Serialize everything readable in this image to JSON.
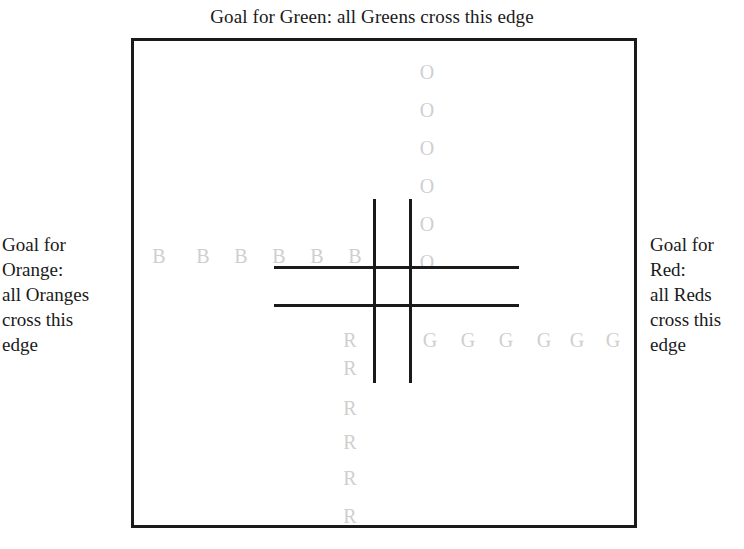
{
  "board": {
    "top_caption": "Goal for Green: all Greens cross this edge",
    "left_caption": {
      "lines": [
        "Goal for",
        "Orange:",
        "all Oranges",
        "cross this",
        "edge"
      ]
    },
    "right_caption": {
      "lines": [
        "Goal for",
        "Red:",
        "all Reds",
        "cross this",
        "edge"
      ]
    },
    "border_color": "#1a1a1a",
    "piece_color": "#cfcfcf",
    "grid_line_color": "#1a1a1a"
  },
  "pieces": {
    "orange": {
      "label": "O",
      "count": 6,
      "orientation": "column",
      "items": [
        {
          "glyph": "O",
          "x": 427,
          "y": 62
        },
        {
          "glyph": "O",
          "x": 427,
          "y": 100
        },
        {
          "glyph": "O",
          "x": 427,
          "y": 138
        },
        {
          "glyph": "O",
          "x": 427,
          "y": 176
        },
        {
          "glyph": "O",
          "x": 427,
          "y": 214
        },
        {
          "glyph": "O",
          "x": 427,
          "y": 252
        }
      ]
    },
    "blue": {
      "label": "B",
      "count": 6,
      "orientation": "row",
      "items": [
        {
          "glyph": "B",
          "x": 159,
          "y": 246
        },
        {
          "glyph": "B",
          "x": 203,
          "y": 246
        },
        {
          "glyph": "B",
          "x": 241,
          "y": 246
        },
        {
          "glyph": "B",
          "x": 279,
          "y": 246
        },
        {
          "glyph": "B",
          "x": 317,
          "y": 246
        },
        {
          "glyph": "B",
          "x": 355,
          "y": 246
        }
      ]
    },
    "green": {
      "label": "G",
      "count": 6,
      "orientation": "row",
      "items": [
        {
          "glyph": "G",
          "x": 430,
          "y": 330
        },
        {
          "glyph": "G",
          "x": 468,
          "y": 330
        },
        {
          "glyph": "G",
          "x": 506,
          "y": 330
        },
        {
          "glyph": "G",
          "x": 544,
          "y": 330
        },
        {
          "glyph": "G",
          "x": 577,
          "y": 330
        },
        {
          "glyph": "G",
          "x": 613,
          "y": 330
        }
      ]
    },
    "red": {
      "label": "R",
      "count": 6,
      "orientation": "column",
      "items": [
        {
          "glyph": "R",
          "x": 350,
          "y": 330
        },
        {
          "glyph": "R",
          "x": 350,
          "y": 358
        },
        {
          "glyph": "R",
          "x": 350,
          "y": 398
        },
        {
          "glyph": "R",
          "x": 350,
          "y": 432
        },
        {
          "glyph": "R",
          "x": 350,
          "y": 468
        },
        {
          "glyph": "R",
          "x": 350,
          "y": 506
        }
      ]
    }
  }
}
